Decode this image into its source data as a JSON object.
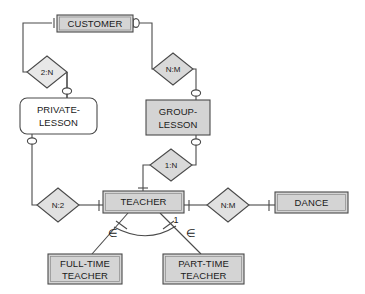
{
  "diagram": {
    "colors": {
      "entity_fill": "#d4d4d4",
      "entity_fill_weak": "#ffffff",
      "relationship_fill": "#d9d9d9",
      "stroke": "#4a4a4a",
      "text": "#1a1a1a",
      "background": "#ffffff"
    },
    "entities": [
      {
        "id": "customer",
        "label": "CUSTOMER",
        "shape": "rect",
        "fill": "gray",
        "x": 57,
        "y": 15,
        "w": 76,
        "h": 17
      },
      {
        "id": "private",
        "label": "PRIVATE-LESSON",
        "line1": "PRIVATE-",
        "line2": "LESSON",
        "shape": "rounded-rect",
        "fill": "white",
        "x": 20,
        "y": 98,
        "w": 77,
        "h": 36
      },
      {
        "id": "group",
        "label": "GROUP-LESSON",
        "line1": "GROUP-",
        "line2": "LESSON",
        "shape": "rect",
        "fill": "gray",
        "x": 146,
        "y": 100,
        "w": 64,
        "h": 35
      },
      {
        "id": "teacher",
        "label": "TEACHER",
        "shape": "rect",
        "fill": "gray",
        "x": 103,
        "y": 191,
        "w": 81,
        "h": 22
      },
      {
        "id": "dance",
        "label": "DANCE",
        "shape": "rect",
        "fill": "gray",
        "x": 275,
        "y": 192,
        "w": 73,
        "h": 21
      },
      {
        "id": "fulltime",
        "label": "FULL-TIME TEACHER",
        "line1": "FULL-TIME",
        "line2": "TEACHER",
        "shape": "rect",
        "fill": "gray",
        "x": 48,
        "y": 254,
        "w": 74,
        "h": 30
      },
      {
        "id": "parttime",
        "label": "PART-TIME TEACHER",
        "line1": "PART-TIME",
        "line2": "TEACHER",
        "shape": "rect",
        "fill": "gray",
        "x": 163,
        "y": 254,
        "w": 81,
        "h": 30
      }
    ],
    "relationships": [
      {
        "id": "cust-private",
        "label": "2:N",
        "cx": 47,
        "cy": 72,
        "rx": 20,
        "ry": 16,
        "connects": [
          "customer",
          "private"
        ]
      },
      {
        "id": "cust-group",
        "label": "N:M",
        "cx": 173,
        "cy": 69,
        "rx": 20,
        "ry": 16,
        "connects": [
          "customer",
          "group"
        ]
      },
      {
        "id": "group-teach",
        "label": "1:N",
        "cx": 171,
        "cy": 165,
        "rx": 21,
        "ry": 16,
        "connects": [
          "group",
          "teacher"
        ]
      },
      {
        "id": "private-teach",
        "label": "N:2",
        "cx": 58,
        "cy": 205,
        "rx": 21,
        "ry": 17,
        "connects": [
          "private",
          "teacher"
        ]
      },
      {
        "id": "teach-dance",
        "label": "N:M",
        "cx": 228,
        "cy": 205,
        "rx": 21,
        "ry": 17,
        "connects": [
          "teacher",
          "dance"
        ]
      }
    ],
    "specialization": {
      "parent": "teacher",
      "children": [
        "fulltime",
        "parttime"
      ],
      "subset_symbol": "∈",
      "disjoint_label": "1",
      "left_subset_x": 113,
      "left_subset_y": 234,
      "right_subset_x": 191,
      "right_subset_y": 234,
      "disjoint_x": 176,
      "disjoint_y": 221
    }
  }
}
